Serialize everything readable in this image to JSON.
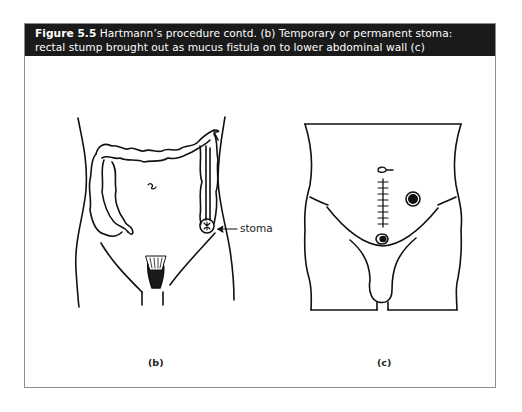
{
  "figure": {
    "number": "Figure 5.5",
    "caption": " Hartmann’s procedure contd. (b) Temporary or permanent stoma: rectal stump brought out as mucus fistula on to lower abdominal wall (c)",
    "header_color": "#1a1a1a",
    "border_color": "#8c8c8c"
  },
  "panels": [
    {
      "label": "(b)",
      "description": "Frontal abdomen with colon outline; end colostomy stoma in left iliac fossa",
      "annotations": [
        {
          "text": "stoma",
          "arrow": "left-pointing"
        }
      ]
    },
    {
      "label": "(c)",
      "description": "Frontal lower trunk showing sutured midline incision, stoma on left abdomen, and mucus fistula above pubis",
      "annotations": []
    }
  ]
}
